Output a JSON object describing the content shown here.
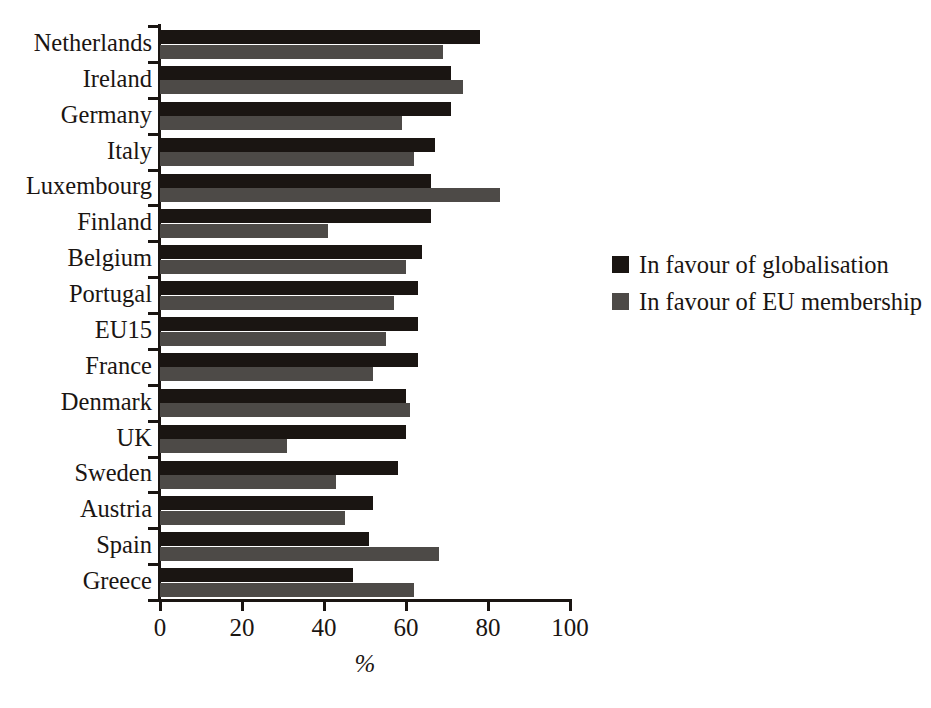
{
  "chart_data": {
    "type": "bar",
    "orientation": "horizontal",
    "title": "",
    "xlabel": "%",
    "ylabel": "",
    "xlim": [
      0,
      100
    ],
    "xticks": [
      0,
      20,
      40,
      60,
      80,
      100
    ],
    "grid": false,
    "legend_position": "right",
    "categories": [
      "Netherlands",
      "Ireland",
      "Germany",
      "Italy",
      "Luxembourg",
      "Finland",
      "Belgium",
      "Portugal",
      "EU15",
      "France",
      "Denmark",
      "UK",
      "Sweden",
      "Austria",
      "Spain",
      "Greece"
    ],
    "series": [
      {
        "name": "In favour of globalisation",
        "color": "#1a1512",
        "values": [
          78,
          71,
          71,
          67,
          66,
          66,
          64,
          63,
          63,
          63,
          60,
          60,
          58,
          52,
          51,
          47
        ]
      },
      {
        "name": "In favour of EU membership",
        "color": "#4d4a47",
        "values": [
          69,
          74,
          59,
          62,
          83,
          41,
          60,
          57,
          55,
          52,
          61,
          31,
          43,
          45,
          68,
          62
        ]
      }
    ]
  },
  "axis": {
    "x_tick_labels": [
      "0",
      "20",
      "40",
      "60",
      "80",
      "100"
    ],
    "x_title": "%"
  },
  "legend": {
    "items": [
      {
        "label": "In favour of globalisation",
        "swatch": "black"
      },
      {
        "label": "In favour of EU membership",
        "swatch": "gray"
      }
    ]
  }
}
